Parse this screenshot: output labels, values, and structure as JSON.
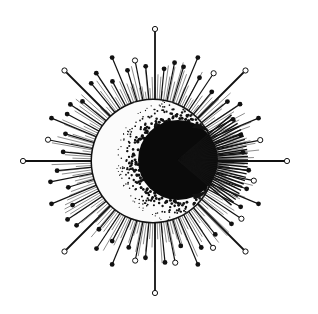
{
  "illustration": {
    "subject": "crescent moon with radiating sunburst",
    "colors": {
      "background": "#ffffff",
      "ink": "#111111",
      "moon_light": "#fbfbfb",
      "moon_shadow": "#0a0a0a",
      "ray_shade": "#555555"
    },
    "center": [
      155,
      161
    ],
    "moon": {
      "cx": 153,
      "cy": 161,
      "r": 61
    },
    "shadow_disk": {
      "cx": 178,
      "cy": 160,
      "r": 40
    },
    "cardinal_rays": [
      {
        "x": 157,
        "y": 34,
        "end": "open"
      },
      {
        "x": 24,
        "y": 159,
        "end": "open"
      },
      {
        "x": 288,
        "y": 164,
        "end": "open"
      },
      {
        "x": 153,
        "y": 289,
        "end": "open"
      }
    ],
    "diagonal_rays": [
      {
        "x": 64,
        "y": 70,
        "end": "open"
      },
      {
        "x": 250,
        "y": 72,
        "end": "open"
      },
      {
        "x": 62,
        "y": 249,
        "end": "open"
      },
      {
        "x": 247,
        "y": 253,
        "end": "open"
      }
    ],
    "ray_count": 64
  }
}
